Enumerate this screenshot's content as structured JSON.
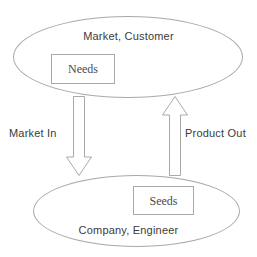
{
  "diagram": {
    "stroke_color": "#a9a9a9",
    "text_color": "#3b3b3b",
    "background_color": "#ffffff",
    "nodes": [
      {
        "id": "market-customer",
        "shape": "ellipse",
        "label": "Market, Customer",
        "inner_box": {
          "id": "needs",
          "shape": "rectangle",
          "label": "Needs"
        }
      },
      {
        "id": "company-engineer",
        "shape": "ellipse",
        "label": "Company, Engineer",
        "inner_box": {
          "id": "seeds",
          "shape": "rectangle",
          "label": "Seeds"
        }
      }
    ],
    "flows": [
      {
        "id": "market-in",
        "label": "Market In",
        "direction": "down",
        "from": "market-customer",
        "to": "company-engineer",
        "icon": "block-arrow-down-icon"
      },
      {
        "id": "product-out",
        "label": "Product Out",
        "direction": "up",
        "from": "company-engineer",
        "to": "market-customer",
        "icon": "block-arrow-up-icon"
      }
    ]
  }
}
